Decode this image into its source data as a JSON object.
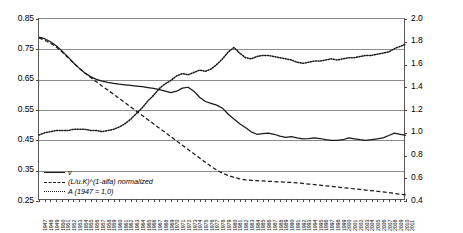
{
  "chart_data": {
    "type": "line",
    "title": "",
    "xlabel": "",
    "ylabel": "",
    "y2label": "",
    "ylim": [
      0.25,
      0.85
    ],
    "y2lim": [
      0.4,
      2.0
    ],
    "yticks": [
      "0.85",
      "0.75",
      "0.65",
      "0.55",
      "0.45",
      "0.35",
      "0.25"
    ],
    "y2ticks": [
      "2.0",
      "1.8",
      "1.6",
      "1.4",
      "1.2",
      "1.0",
      "0.8",
      "0.6",
      "0.4"
    ],
    "grid": true,
    "legend_position": "bottom-left",
    "x": [
      1947,
      1948,
      1949,
      1950,
      1951,
      1952,
      1953,
      1954,
      1955,
      1956,
      1957,
      1958,
      1959,
      1960,
      1961,
      1962,
      1963,
      1964,
      1965,
      1966,
      1967,
      1968,
      1969,
      1970,
      1971,
      1972,
      1973,
      1974,
      1975,
      1976,
      1977,
      1978,
      1979,
      1980,
      1981,
      1982,
      1983,
      1984,
      1985,
      1986,
      1987,
      1988,
      1989,
      1990,
      1991,
      1992,
      1993,
      1994,
      1995,
      1996,
      1997,
      1998,
      1999,
      2000,
      2001,
      2002,
      2003,
      2004,
      2005,
      2006,
      2007,
      2008,
      2009,
      2010,
      2011
    ],
    "categories": [
      "1947",
      "1948",
      "1949",
      "1950",
      "1951",
      "1952",
      "1953",
      "1954",
      "1955",
      "1956",
      "1957",
      "1958",
      "1959",
      "1960",
      "1961",
      "1962",
      "1963",
      "1964",
      "1965",
      "1966",
      "1967",
      "1968",
      "1969",
      "1970",
      "1971",
      "1972",
      "1973",
      "1974",
      "1975",
      "1976",
      "1977",
      "1978",
      "1979",
      "1980",
      "1981",
      "1982",
      "1983",
      "1984",
      "1985",
      "1986",
      "1987",
      "1988",
      "1989",
      "1990",
      "1991",
      "1992",
      "1993",
      "1994",
      "1995",
      "1996",
      "1997",
      "1998",
      "1999",
      "2000",
      "2001",
      "2002",
      "2003",
      "2004",
      "2005",
      "2006",
      "2007",
      "2008",
      "2009",
      "2010",
      "2011"
    ],
    "series": [
      {
        "name": "v",
        "axis": "left",
        "style": "solid",
        "color": "#1a1a1a",
        "values": [
          0.79,
          0.785,
          0.775,
          0.762,
          0.745,
          0.726,
          0.706,
          0.688,
          0.672,
          0.66,
          0.651,
          0.645,
          0.641,
          0.638,
          0.635,
          0.633,
          0.631,
          0.629,
          0.627,
          0.624,
          0.621,
          0.617,
          0.612,
          0.607,
          0.612,
          0.622,
          0.625,
          0.612,
          0.592,
          0.578,
          0.572,
          0.566,
          0.556,
          0.536,
          0.52,
          0.505,
          0.492,
          0.478,
          0.47,
          0.472,
          0.474,
          0.47,
          0.464,
          0.46,
          0.462,
          0.458,
          0.455,
          0.456,
          0.458,
          0.456,
          0.452,
          0.45,
          0.45,
          0.452,
          0.458,
          0.455,
          0.452,
          0.45,
          0.452,
          0.455,
          0.458,
          0.466,
          0.474,
          0.47,
          0.466
        ]
      },
      {
        "name": "(L/u.K)^(1-alfa) normalized",
        "axis": "left",
        "style": "dashed",
        "color": "#1a1a1a",
        "values": [
          0.788,
          0.78,
          0.77,
          0.758,
          0.742,
          0.724,
          0.705,
          0.688,
          0.672,
          0.657,
          0.643,
          0.629,
          0.616,
          0.602,
          0.588,
          0.574,
          0.56,
          0.546,
          0.532,
          0.518,
          0.504,
          0.49,
          0.476,
          0.462,
          0.448,
          0.434,
          0.42,
          0.406,
          0.392,
          0.378,
          0.364,
          0.352,
          0.342,
          0.334,
          0.328,
          0.323,
          0.32,
          0.318,
          0.317,
          0.316,
          0.315,
          0.314,
          0.313,
          0.312,
          0.311,
          0.31,
          0.308,
          0.306,
          0.304,
          0.302,
          0.3,
          0.298,
          0.296,
          0.294,
          0.292,
          0.29,
          0.288,
          0.286,
          0.284,
          0.282,
          0.28,
          0.278,
          0.275,
          0.272,
          0.27
        ]
      },
      {
        "name": "A (1947 = 1,0)",
        "axis": "right",
        "style": "dotted",
        "color": "#1a1a1a",
        "values": [
          0.98,
          1.0,
          1.01,
          1.02,
          1.02,
          1.02,
          1.03,
          1.03,
          1.03,
          1.02,
          1.02,
          1.01,
          1.02,
          1.03,
          1.05,
          1.08,
          1.12,
          1.17,
          1.22,
          1.28,
          1.33,
          1.39,
          1.43,
          1.46,
          1.5,
          1.52,
          1.51,
          1.53,
          1.55,
          1.54,
          1.56,
          1.6,
          1.65,
          1.71,
          1.75,
          1.7,
          1.66,
          1.65,
          1.67,
          1.68,
          1.68,
          1.67,
          1.66,
          1.65,
          1.64,
          1.62,
          1.61,
          1.62,
          1.63,
          1.63,
          1.64,
          1.65,
          1.64,
          1.65,
          1.66,
          1.66,
          1.67,
          1.68,
          1.68,
          1.69,
          1.7,
          1.71,
          1.74,
          1.76,
          1.78
        ]
      }
    ]
  },
  "legend": {
    "items": [
      {
        "label": "v",
        "style": "solid"
      },
      {
        "label": "(L/u.K)^(1-alfa) normalized",
        "style": "dashed"
      },
      {
        "label": "A (1947 = 1,0)",
        "style": "dotted"
      }
    ]
  }
}
